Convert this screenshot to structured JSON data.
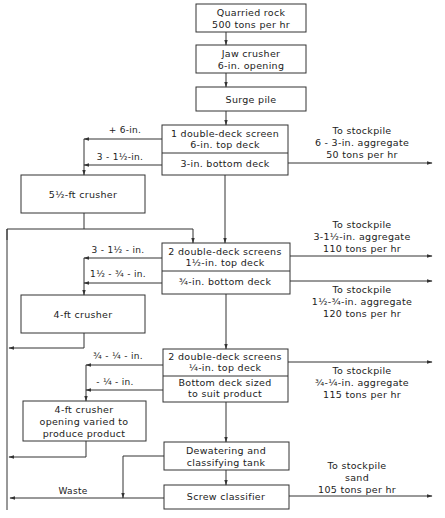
{
  "diagram": {
    "nodes": {
      "quarried_rock": {
        "line1": "Quarried rock",
        "line2": "500 tons per hr"
      },
      "jaw_crusher": {
        "line1": "Jaw crusher",
        "line2": "6-in. opening"
      },
      "surge_pile": {
        "line1": "Surge pile"
      },
      "screen1": {
        "top1": "1 double-deck screen",
        "top2": "6-in. top deck",
        "bottom": "3-in. bottom deck"
      },
      "crusher1": {
        "line1": "5½-ft crusher"
      },
      "screen2": {
        "top1": "2 double-deck screens",
        "top2": "1½-in. top deck",
        "bottom": "¾-in. bottom deck"
      },
      "crusher2": {
        "line1": "4-ft crusher"
      },
      "screen3": {
        "top1": "2 double-deck screens",
        "top2": "¼-in. top deck",
        "bottom1": "Bottom deck sized",
        "bottom2": "to suit product"
      },
      "crusher3": {
        "line1": "4-ft crusher",
        "line2": "opening varied to",
        "line3": "produce product"
      },
      "dewatering": {
        "line1": "Dewatering and",
        "line2": "classifying tank"
      },
      "screw": {
        "line1": "Screw classifier"
      }
    },
    "edge_labels": {
      "plus6": "+ 6-in.",
      "s1_3to1half": "3 - 1½-in.",
      "s2_3to1half": "3 - 1½ - in.",
      "s2_1halfto3q": "1½ - ¾ - in.",
      "s3_3qto1q": "¾ - ¼ - in.",
      "s3_minus1q": "- ¼ - in.",
      "waste": "Waste"
    },
    "outputs": {
      "out1": {
        "line1": "To stockpile",
        "line2": "6 - 3-in. aggregate",
        "line3": "50 tons per hr"
      },
      "out2": {
        "line1": "To stockpile",
        "line2": "3-1½-in. aggregate",
        "line3": "110 tons per hr"
      },
      "out3": {
        "line1": "To stockpile",
        "line2": "1½-¾-in. aggregate",
        "line3": "120 tons per hr"
      },
      "out4": {
        "line1": "To stockpile",
        "line2": "¾-¼-in. aggregate",
        "line3": "115 tons per hr"
      },
      "out5": {
        "line1": "To stockpile",
        "line2": "sand",
        "line3": "105 tons per hr"
      }
    },
    "colors": {
      "line": "#333333",
      "background": "#ffffff"
    }
  }
}
